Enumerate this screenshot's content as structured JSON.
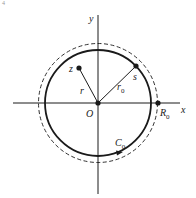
{
  "figure": {
    "corner_mark": "4",
    "axes": {
      "x_label": "x",
      "y_label": "y",
      "origin_label": "O"
    },
    "points": {
      "z": "z",
      "s": "s",
      "R0": {
        "main": "R",
        "sub": "0"
      }
    },
    "segments": {
      "r": "r",
      "r0": {
        "main": "r",
        "sub": "0"
      }
    },
    "contour": {
      "main": "C",
      "sub": "0"
    },
    "colors": {
      "stroke": "#1a1a1a",
      "background": "#ffffff"
    }
  }
}
